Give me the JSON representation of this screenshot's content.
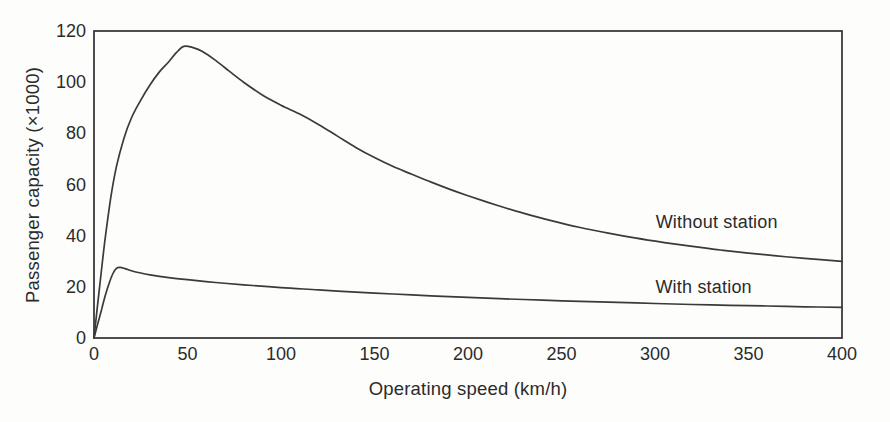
{
  "style": {
    "background": "#fdfdfc",
    "ink": "#333333",
    "curve_color": "#3a3a3a",
    "frame_color": "#2f2f2f"
  },
  "chart_data": {
    "type": "line",
    "title": "",
    "xlabel": "Operating speed (km/h)",
    "ylabel": "Passenger capacity (×1000)",
    "xlim": [
      0,
      400
    ],
    "ylim": [
      0,
      120
    ],
    "x_ticks": [
      0,
      50,
      100,
      150,
      200,
      250,
      300,
      350,
      400
    ],
    "y_ticks": [
      0,
      20,
      40,
      60,
      80,
      100,
      120
    ],
    "grid": false,
    "legend_position": "inline-annotations",
    "series": [
      {
        "name": "Without station",
        "label_at": [
          333,
          45.5
        ],
        "points": [
          [
            0,
            0
          ],
          [
            3,
            20
          ],
          [
            6,
            39
          ],
          [
            9,
            55
          ],
          [
            12,
            67
          ],
          [
            16,
            78
          ],
          [
            20,
            86
          ],
          [
            25,
            93
          ],
          [
            30,
            99
          ],
          [
            35,
            104
          ],
          [
            40,
            108
          ],
          [
            44,
            111.5
          ],
          [
            48,
            114
          ],
          [
            53,
            113.5
          ],
          [
            58,
            112
          ],
          [
            65,
            108.5
          ],
          [
            72,
            104.5
          ],
          [
            80,
            100
          ],
          [
            90,
            95
          ],
          [
            100,
            91
          ],
          [
            110,
            87.5
          ],
          [
            120,
            83.5
          ],
          [
            130,
            79
          ],
          [
            140,
            74.5
          ],
          [
            150,
            70.5
          ],
          [
            160,
            67
          ],
          [
            170,
            64
          ],
          [
            180,
            61
          ],
          [
            190,
            58.2
          ],
          [
            200,
            55.6
          ],
          [
            215,
            52
          ],
          [
            230,
            48.7
          ],
          [
            245,
            45.8
          ],
          [
            260,
            43.2
          ],
          [
            275,
            41
          ],
          [
            290,
            39
          ],
          [
            305,
            37.3
          ],
          [
            320,
            35.8
          ],
          [
            335,
            34.4
          ],
          [
            350,
            33.2
          ],
          [
            365,
            32.1
          ],
          [
            380,
            31.1
          ],
          [
            400,
            30
          ]
        ]
      },
      {
        "name": "With station",
        "label_at": [
          326,
          20
        ],
        "points": [
          [
            0,
            0
          ],
          [
            2,
            5.5
          ],
          [
            4,
            11
          ],
          [
            6,
            16.5
          ],
          [
            8,
            21.2
          ],
          [
            10,
            25
          ],
          [
            12,
            27.2
          ],
          [
            14,
            27.6
          ],
          [
            17,
            27
          ],
          [
            20,
            26.3
          ],
          [
            25,
            25.4
          ],
          [
            30,
            24.7
          ],
          [
            40,
            23.6
          ],
          [
            50,
            22.8
          ],
          [
            65,
            21.7
          ],
          [
            80,
            20.8
          ],
          [
            100,
            19.7
          ],
          [
            120,
            18.8
          ],
          [
            140,
            17.9
          ],
          [
            160,
            17.2
          ],
          [
            180,
            16.5
          ],
          [
            200,
            15.9
          ],
          [
            220,
            15.3
          ],
          [
            240,
            14.8
          ],
          [
            260,
            14.3
          ],
          [
            280,
            13.9
          ],
          [
            300,
            13.5
          ],
          [
            320,
            13.1
          ],
          [
            340,
            12.8
          ],
          [
            360,
            12.5
          ],
          [
            380,
            12.2
          ],
          [
            400,
            12
          ]
        ]
      }
    ]
  }
}
